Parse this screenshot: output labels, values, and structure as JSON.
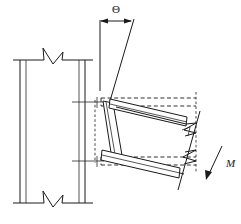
{
  "figure": {
    "kind": "engineering-line-drawing",
    "background_color": "#ffffff",
    "line_color": "#1a1a1a",
    "width": 241,
    "height": 224
  },
  "labels": {
    "rotation_angle": "Θ",
    "moment": "M"
  },
  "annotations": {
    "rotation_dimension": {
      "symbol": "Θ",
      "style": "double-headed-arrow",
      "between": "vertical reference line and rotated beam axis"
    },
    "moment_arrow": {
      "symbol": "M",
      "style": "single-headed-inclined-arrow",
      "direction": "down-left"
    }
  },
  "components": {
    "column": {
      "name": "steel column",
      "orientation": "vertical",
      "break_symbol_top": true,
      "break_symbol_bottom": true
    },
    "beam": {
      "name": "steel beam",
      "orientation": "rotated",
      "break_symbol_right": true
    },
    "end_plate": {
      "name": "bolted end plate",
      "orientation": "rotated"
    },
    "reference_lines": {
      "style": "dashed",
      "meaning": "original undeformed position"
    }
  }
}
